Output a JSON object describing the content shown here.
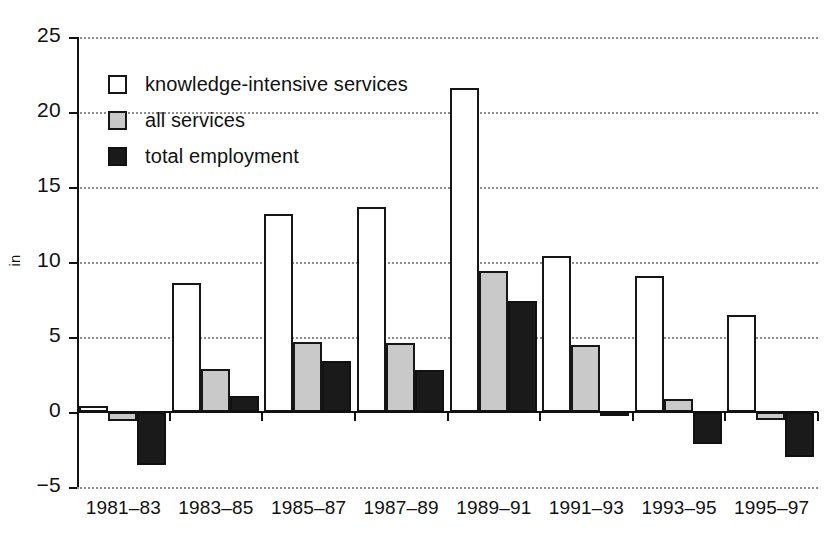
{
  "chart_data": {
    "type": "bar",
    "title": "",
    "subtitle": "",
    "xlabel": "",
    "ylabel": "in",
    "ylim": [
      -5,
      25
    ],
    "ytick_step": 5,
    "yticks": [
      -5,
      0,
      5,
      10,
      15,
      20,
      25
    ],
    "ytick_labels": [
      "-5",
      "0",
      "5",
      "10",
      "15",
      "20",
      "25"
    ],
    "grid": true,
    "grid_style": "dotted-horizontal",
    "legend_position": "upper-left-inside",
    "categories": [
      "1981–83",
      "1983–85",
      "1985–87",
      "1987–89",
      "1989–91",
      "1991–93",
      "1993–95",
      "1995–97"
    ],
    "series": [
      {
        "name": "knowledge-intensive services",
        "color": "#ffffff",
        "edge_color": "#161616",
        "values": [
          0.4,
          8.6,
          13.2,
          13.7,
          21.6,
          10.4,
          9.1,
          6.5
        ]
      },
      {
        "name": "all services",
        "color": "#c9c9c9",
        "edge_color": "#161616",
        "values": [
          -0.6,
          2.9,
          4.7,
          4.6,
          9.4,
          4.5,
          0.9,
          -0.5
        ]
      },
      {
        "name": "total employment",
        "color": "#1a1a1a",
        "edge_color": "#111111",
        "values": [
          -3.5,
          1.1,
          3.4,
          2.8,
          7.4,
          -0.2,
          -2.1,
          -3.0
        ]
      }
    ]
  },
  "legend": {
    "items": [
      {
        "label": "knowledge-intensive services",
        "swatch": "white-square-outline"
      },
      {
        "label": "all services",
        "swatch": "gray-square"
      },
      {
        "label": "total employment",
        "swatch": "black-square"
      }
    ]
  },
  "axes": {
    "y_axis_label": "in",
    "y_tick_labels": [
      "25",
      "20",
      "15",
      "10",
      "5",
      "0",
      "-5"
    ],
    "x_tick_labels": [
      "1981–83",
      "1983–85",
      "1985–87",
      "1987–89",
      "1989–91",
      "1991–93",
      "1993–95",
      "1995–97"
    ]
  }
}
